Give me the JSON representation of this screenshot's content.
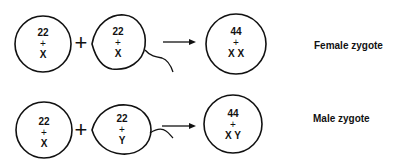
{
  "rows": [
    {
      "egg": {
        "autosomes": "22",
        "plus": "+",
        "sex": "X"
      },
      "join": "+",
      "sperm": {
        "autosomes": "22",
        "plus": "+",
        "sex": "X"
      },
      "zygote": {
        "autosomes": "44",
        "plus": "+",
        "sex": "X X"
      },
      "label": "Female zygote"
    },
    {
      "egg": {
        "autosomes": "22",
        "plus": "+",
        "sex": "X"
      },
      "join": "+",
      "sperm": {
        "autosomes": "22",
        "plus": "+",
        "sex": "Y"
      },
      "zygote": {
        "autosomes": "44",
        "plus": "+",
        "sex": "X Y"
      },
      "label": "Male zygote"
    }
  ]
}
